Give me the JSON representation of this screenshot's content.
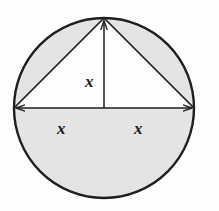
{
  "figure": {
    "background_color": "#fefefe",
    "shade_color": "#e4e4e4",
    "stroke_color": "#1e1e1e",
    "label_color": "#1b1b1b",
    "circle": {
      "center_x": 104,
      "center_y": 108,
      "radius": 90,
      "stroke_width": 2.4
    },
    "diameter_line": {
      "name": "horizontal-diameter",
      "x1": 14,
      "y1": 108,
      "x2": 194,
      "y2": 108,
      "arrowheads": "both-ends"
    },
    "radius_line": {
      "name": "vertical-radius",
      "x1": 104,
      "y1": 108,
      "x2": 104,
      "y2": 18,
      "arrowheads": "top-end"
    },
    "chords": [
      {
        "name": "left-chord",
        "x1": 14,
        "y1": 108,
        "x2": 104,
        "y2": 18
      },
      {
        "name": "right-chord",
        "x1": 194,
        "y1": 108,
        "x2": 104,
        "y2": 18
      }
    ],
    "apex": {
      "x": 104,
      "y": 18
    },
    "shaded_regions": [
      "lower-semicircle",
      "upper-left-circular-segment",
      "upper-right-circular-segment"
    ],
    "unshaded_regions": [
      "inscribed-triangle-interior"
    ],
    "labels": {
      "height": "x",
      "left_half": "x",
      "right_half": "x"
    }
  }
}
